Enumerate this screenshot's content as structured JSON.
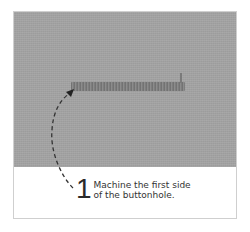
{
  "step": {
    "number": "1",
    "line1": "Machine the first side",
    "line2": "of the buttonhole."
  },
  "colors": {
    "fabric": "#a4a4a4",
    "stitch": "#7a7a7a",
    "arrow": "#333333",
    "border": "#cfcfcf"
  }
}
